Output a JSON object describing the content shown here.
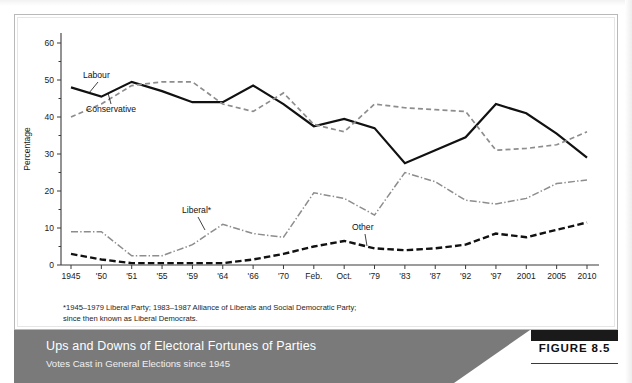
{
  "chart_data": {
    "type": "line",
    "title": "Ups and Downs of Electoral Fortunes of Parties",
    "subtitle": "Votes Cast in General Elections since 1945",
    "xlabel": "",
    "ylabel": "Percentage",
    "ylim": [
      0,
      60
    ],
    "yticks": [
      0,
      10,
      20,
      30,
      40,
      50,
      60
    ],
    "grid": false,
    "legend_position": "inline-annotations",
    "categories": [
      "1945",
      "'50",
      "'51",
      "'55",
      "'59",
      "'64",
      "'66",
      "'70",
      "Feb. '74",
      "Oct. '74",
      "'79",
      "'83",
      "'87",
      "'92",
      "'97",
      "2001",
      "2005",
      "2010"
    ],
    "tick_labels_top": [
      "1945",
      "'50",
      "'51",
      "'55",
      "'59",
      "'64",
      "'66",
      "'70",
      "Feb.",
      "Oct.",
      "'79",
      "'83",
      "'87",
      "'92",
      "'97",
      "2001",
      "2005",
      "2010"
    ],
    "tick_labels_bottom": [
      "",
      "",
      "",
      "",
      "",
      "",
      "",
      "",
      "'74",
      "'74",
      "",
      "",
      "",
      "",
      "",
      "",
      "",
      ""
    ],
    "series": [
      {
        "name": "Labour",
        "style": "solid-black",
        "color": "#111111",
        "values": [
          48.0,
          45.5,
          49.5,
          47.0,
          44.0,
          44.0,
          48.5,
          43.5,
          37.5,
          39.5,
          37.0,
          27.5,
          31.0,
          34.5,
          43.5,
          41.0,
          35.5,
          29.0
        ]
      },
      {
        "name": "Conservative",
        "style": "dashed-gray",
        "color": "#8d8d8d",
        "values": [
          40.0,
          43.5,
          48.5,
          49.5,
          49.5,
          43.5,
          41.5,
          46.5,
          38.0,
          36.0,
          43.5,
          42.5,
          42.0,
          41.5,
          31.0,
          31.5,
          32.5,
          36.0
        ]
      },
      {
        "name": "Liberal*",
        "style": "dash-dot-gray",
        "color": "#8d8d8d",
        "values": [
          9.0,
          9.0,
          2.5,
          2.5,
          5.5,
          11.0,
          8.5,
          7.5,
          19.5,
          18.0,
          13.5,
          25.0,
          22.5,
          17.5,
          16.5,
          18.0,
          22.0,
          23.0
        ]
      },
      {
        "name": "Other",
        "style": "dashed-black",
        "color": "#111111",
        "values": [
          3.0,
          1.5,
          0.5,
          0.5,
          0.5,
          0.5,
          1.5,
          3.0,
          5.0,
          6.5,
          4.5,
          4.0,
          4.5,
          5.5,
          8.5,
          7.5,
          9.5,
          11.5
        ]
      }
    ],
    "annotations": [
      {
        "name": "Labour",
        "text": "Labour"
      },
      {
        "name": "Conservative",
        "text": "Conservative"
      },
      {
        "name": "Liberal",
        "text": "Liberal*"
      },
      {
        "name": "Other",
        "text": "Other"
      }
    ]
  },
  "axis": {
    "y_title": "Percentage",
    "y_tick_0": "0",
    "y_tick_10": "10",
    "y_tick_20": "20",
    "y_tick_30": "30",
    "y_tick_40": "40",
    "y_tick_50": "50",
    "y_tick_60": "60"
  },
  "annotations": {
    "labour": "Labour",
    "conservative": "Conservative",
    "liberal": "Liberal*",
    "other": "Other"
  },
  "footnote": {
    "line1": "*1945–1979 Liberal Party; 1983–1987 Alliance of Liberals and Social Democratic Party;",
    "line2": "since then known as Liberal Democrats."
  },
  "caption": {
    "title": "Ups and Downs of Electoral Fortunes of Parties",
    "subtitle": "Votes Cast in General Elections since 1945",
    "figure_label": "FIGURE 8.5"
  },
  "colors": {
    "caption_band": "#7a7a7a",
    "labour": "#111111",
    "conservative": "#8d8d8d",
    "liberal": "#8d8d8d",
    "other": "#111111"
  }
}
